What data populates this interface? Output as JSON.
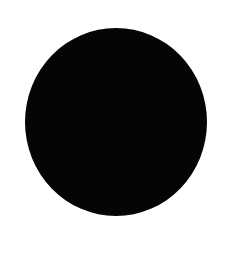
{
  "image": {
    "title": "Solid black circle on white background",
    "description": "A single large filled black disc, slightly irregular at the edge, centered on a plain white background.",
    "width": 235,
    "height": 255,
    "background_color": "#ffffff"
  },
  "shapes": [
    {
      "name": "black-circle",
      "type": "ellipse",
      "fill_color": "#050505",
      "stroke_color": "none",
      "center_x": 116,
      "center_y": 122,
      "radius_x": 91,
      "radius_y": 94,
      "edge_quality": "soft antialiased, slightly hand-drawn"
    }
  ],
  "text_content": []
}
